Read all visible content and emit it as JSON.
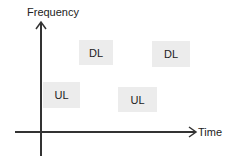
{
  "axes": {
    "y_label": "Frequency",
    "x_label": "Time"
  },
  "blocks": [
    {
      "label": "DL",
      "x": 79,
      "y": 40,
      "w": 34,
      "h": 25
    },
    {
      "label": "DL",
      "x": 152,
      "y": 41,
      "w": 38,
      "h": 26
    },
    {
      "label": "UL",
      "x": 43,
      "y": 82,
      "w": 37,
      "h": 26
    },
    {
      "label": "UL",
      "x": 118,
      "y": 87,
      "w": 39,
      "h": 25
    }
  ],
  "colors": {
    "axis": "#333333",
    "block_fill": "#ececec",
    "text": "#222222"
  }
}
